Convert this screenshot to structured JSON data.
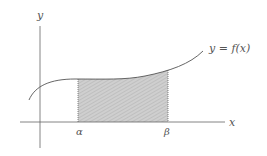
{
  "diagram": {
    "y_axis_label": "y",
    "x_axis_label": "x",
    "curve_label": "y = f(x)",
    "lower_bound_label": "α",
    "upper_bound_label": "β",
    "shade_color": "#c8c8c8",
    "line_color": "#555555"
  }
}
